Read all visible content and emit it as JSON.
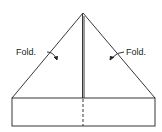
{
  "diagram": {
    "labels": {
      "left_fold": "Fold.",
      "right_fold": "Fold."
    },
    "colors": {
      "stroke": "#231f20",
      "background": "#ffffff"
    }
  }
}
